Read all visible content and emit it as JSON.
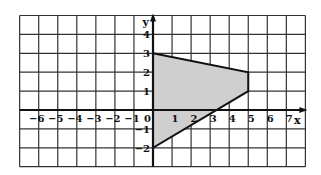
{
  "figure": {
    "type": "coordinate-grid",
    "x_axis_label": "x",
    "y_axis_label": "y",
    "x_range": [
      -7,
      8
    ],
    "y_range": [
      -3,
      5
    ],
    "x_tick_labels": [
      "−6",
      "−5",
      "−4",
      "−3",
      "−2",
      "−1",
      "0",
      "1",
      "2",
      "3",
      "4",
      "5",
      "6",
      "7"
    ],
    "y_tick_labels": [
      "4",
      "3",
      "2",
      "1",
      "−1",
      "−2"
    ],
    "shaded_polygon": {
      "vertices": [
        [
          0,
          3
        ],
        [
          5,
          2
        ],
        [
          5,
          1
        ],
        [
          0,
          -2
        ]
      ],
      "fill_color": "#cfcfcf",
      "stroke_color": "#111111"
    },
    "grid_color": "#333333",
    "axis_color": "#111111"
  }
}
